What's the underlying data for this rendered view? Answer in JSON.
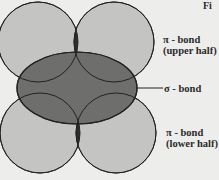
{
  "figure": {
    "caption_fragment": "Fi",
    "colors": {
      "background": "#ededeb",
      "pi_lobe_fill": "#c4c4c2",
      "sigma_fill": "#6e6e6c",
      "pi_overlap_fill": "#2c2c2c",
      "stroke": "#222222"
    }
  },
  "labels": {
    "pi_upper": {
      "line1": "π - bond",
      "line2": "(upper half)"
    },
    "sigma": {
      "line1": "σ - bond"
    },
    "pi_lower": {
      "line1": "π - bond",
      "line2": "(lower half)"
    }
  },
  "shapes": {
    "upper_left_lobe": {
      "cx": 38,
      "cy": 42,
      "r": 40
    },
    "upper_right_lobe": {
      "cx": 114,
      "cy": 42,
      "r": 40
    },
    "lower_left_lobe": {
      "cx": 40,
      "cy": 133,
      "r": 40
    },
    "lower_right_lobe": {
      "cx": 116,
      "cy": 133,
      "r": 40
    },
    "sigma_ellipse": {
      "cx": 77,
      "cy": 88,
      "rx": 60,
      "ry": 36
    },
    "sigma_pointer": {
      "x1": 137,
      "y1": 88,
      "x2": 163,
      "y2": 88
    }
  }
}
